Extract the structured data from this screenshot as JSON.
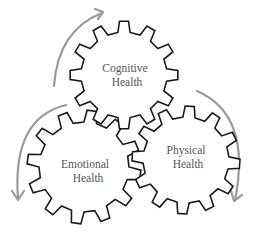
{
  "diagram": {
    "type": "interlocking-gears-cycle",
    "colors": {
      "gear_stroke": "#1a1a1a",
      "gear_fill": "#ffffff",
      "arrow": "#9a9a9a",
      "label_text": "#555555"
    },
    "gears": [
      {
        "id": "cognitive",
        "line1": "Cognitive",
        "line2": "Health",
        "cx": 124,
        "cy": 75,
        "outer_r": 54,
        "inner_r": 43,
        "teeth": 12,
        "rotation": 0
      },
      {
        "id": "emotional",
        "line1": "Emotional",
        "line2": "Health",
        "cx": 84,
        "cy": 167,
        "outer_r": 57,
        "inner_r": 45,
        "teeth": 12,
        "rotation": 8
      },
      {
        "id": "physical",
        "line1": "Physical",
        "line2": "Health",
        "cx": 186,
        "cy": 160,
        "outer_r": 54,
        "inner_r": 43,
        "teeth": 12,
        "rotation": 4
      }
    ],
    "arrows": [
      {
        "id": "arrow-emotional-to-cognitive",
        "direction": "clockwise",
        "position": "upper-left"
      },
      {
        "id": "arrow-cognitive-to-physical",
        "direction": "clockwise",
        "position": "right"
      },
      {
        "id": "arrow-physical-to-emotional",
        "direction": "counter-clockwise",
        "position": "left"
      }
    ]
  }
}
